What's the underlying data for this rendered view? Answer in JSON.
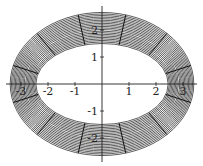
{
  "chart_data": {
    "type": "parametric",
    "title": "",
    "xlabel": "",
    "ylabel": "",
    "xlim": [
      -3.5,
      3.5
    ],
    "ylim": [
      -2.7,
      2.7
    ],
    "grid": false,
    "x_ticks": [
      -3,
      -2,
      -1,
      1,
      2,
      3
    ],
    "y_ticks": [
      -2,
      -1,
      1,
      2
    ],
    "x_tick_labels": [
      "-3",
      "-2",
      "-1",
      "1",
      "2",
      "3"
    ],
    "y_tick_labels": [
      "-2",
      "-1",
      "1",
      "2"
    ],
    "shape": "elliptical annulus",
    "inner_ellipse": {
      "a": 2.45,
      "b": 1.5
    },
    "outer_ellipse": {
      "a": 3.4,
      "b": 2.65
    },
    "concentric_curves": 20,
    "radial_lines": 12,
    "radial_angles_deg": [
      15,
      45,
      75,
      105,
      135,
      165,
      195,
      225,
      255,
      285,
      315,
      345
    ],
    "line_color": "#333333"
  },
  "style": {
    "origin_px": [
      102,
      84
    ],
    "unit_px": 27
  }
}
